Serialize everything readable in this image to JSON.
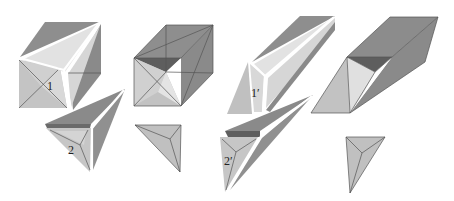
{
  "figure": {
    "colors": {
      "background": "#ffffff",
      "light": "#d8d8d8",
      "lighter": "#e6e6e6",
      "mid": "#b8b8b8",
      "dark": "#8c8c8c",
      "darker": "#6e6e6e",
      "edge": "#555555"
    },
    "panels": [
      {
        "id": "cube-exploded",
        "label_piece_a": "1",
        "label_piece_b": "2"
      },
      {
        "id": "cube-assembled",
        "caption": ""
      },
      {
        "id": "parallelepiped-exploded",
        "label_piece_a": "1′",
        "label_piece_b": "2′"
      },
      {
        "id": "parallelepiped-assembled",
        "caption": ""
      }
    ]
  },
  "labels": {
    "p1": "1",
    "p2": "2",
    "p1prime": "1′",
    "p2prime": "2′"
  }
}
